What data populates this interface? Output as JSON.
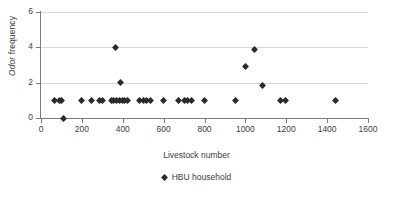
{
  "chart_data": {
    "type": "scatter",
    "title": "",
    "xlabel": "Livestock number",
    "ylabel": "Odor frequency",
    "ylabel_italic_part": "Odor",
    "ylabel_plain_part": " frequency",
    "xlim": [
      0,
      1600
    ],
    "ylim": [
      0,
      6
    ],
    "xticks": [
      0,
      200,
      400,
      600,
      800,
      1000,
      1200,
      1400,
      1600
    ],
    "yticks": [
      0,
      2,
      4,
      6
    ],
    "grid": "horizontal",
    "legend_position": "bottom-center",
    "marker": "diamond",
    "marker_color": "#2b2b2b",
    "series": [
      {
        "name": "HBU household",
        "points": [
          [
            65,
            1
          ],
          [
            90,
            1
          ],
          [
            100,
            1
          ],
          [
            110,
            0
          ],
          [
            200,
            1
          ],
          [
            245,
            1
          ],
          [
            285,
            1
          ],
          [
            300,
            1
          ],
          [
            345,
            1
          ],
          [
            355,
            1
          ],
          [
            365,
            4
          ],
          [
            370,
            1
          ],
          [
            385,
            1
          ],
          [
            390,
            2
          ],
          [
            400,
            1
          ],
          [
            410,
            1
          ],
          [
            425,
            1
          ],
          [
            480,
            1
          ],
          [
            500,
            1
          ],
          [
            515,
            1
          ],
          [
            535,
            1
          ],
          [
            600,
            1
          ],
          [
            675,
            1
          ],
          [
            700,
            1
          ],
          [
            715,
            1
          ],
          [
            735,
            1
          ],
          [
            800,
            1
          ],
          [
            950,
            1
          ],
          [
            1000,
            2.9
          ],
          [
            1045,
            3.85
          ],
          [
            1085,
            1.85
          ],
          [
            1170,
            1
          ],
          [
            1195,
            1
          ],
          [
            1440,
            1
          ]
        ]
      }
    ]
  },
  "legend": {
    "entries": [
      {
        "label": "HBU household",
        "marker": "diamond-marker"
      }
    ]
  },
  "axes": {
    "x_tick_labels": [
      "0",
      "200",
      "400",
      "600",
      "800",
      "1000",
      "1200",
      "1400",
      "1600"
    ],
    "y_tick_labels": [
      "0",
      "2",
      "4",
      "6"
    ]
  }
}
